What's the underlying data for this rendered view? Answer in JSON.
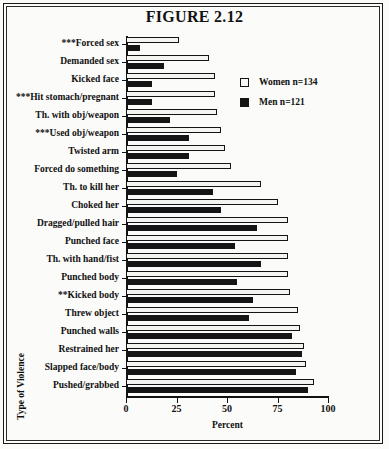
{
  "figure": {
    "title": "FIGURE 2.12",
    "xlabel": "Percent",
    "ylabel": "Type of Violence"
  },
  "legend": {
    "position": "top-right",
    "items": [
      {
        "label": "Women n=134",
        "swatch": "white-square-outline",
        "color": "#ffffff"
      },
      {
        "label": "Men n=121",
        "swatch": "black-square",
        "color": "#151515"
      }
    ]
  },
  "axis": {
    "ticks": [
      {
        "value": 0,
        "label": "0"
      },
      {
        "value": 25,
        "label": "25"
      },
      {
        "value": 50,
        "label": "50"
      },
      {
        "value": 75,
        "label": "75"
      },
      {
        "value": 100,
        "label": "100"
      }
    ]
  },
  "chart_data": {
    "type": "bar",
    "orientation": "horizontal",
    "title": "FIGURE 2.12",
    "xlabel": "Percent",
    "ylabel": "Type of Violence",
    "xlim": [
      0,
      100
    ],
    "grid": false,
    "legend_position": "top-right",
    "categories": [
      "***Forced sex",
      "Demanded sex",
      "Kicked face",
      "***Hit stomach/pregnant",
      "Th. with obj/weapon",
      "***Used obj/weapon",
      "Twisted arm",
      "Forced do something",
      "Th. to kill her",
      "Choked her",
      "Dragged/pulled hair",
      "Punched face",
      "Th. with hand/fist",
      "Punched body",
      "**Kicked body",
      "Threw object",
      "Punched walls",
      "Restrained her",
      "Slapped face/body",
      "Pushed/grabbed"
    ],
    "series": [
      {
        "name": "Women n=134",
        "values": [
          26,
          41,
          44,
          44,
          45,
          47,
          49,
          52,
          67,
          75,
          80,
          80,
          80,
          80,
          81,
          85,
          86,
          88,
          89,
          93
        ]
      },
      {
        "name": "Men n=121",
        "values": [
          7,
          19,
          13,
          13,
          22,
          31,
          31,
          25,
          43,
          47,
          65,
          54,
          67,
          55,
          63,
          61,
          82,
          87,
          84,
          90
        ]
      }
    ]
  }
}
